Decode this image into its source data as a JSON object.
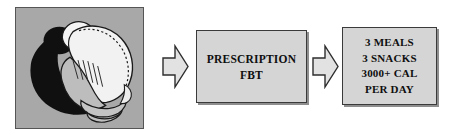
{
  "diagram": {
    "type": "flowchart",
    "orientation": "left-to-right",
    "stage_count": 3,
    "background_color": "#ffffff"
  },
  "illustration": {
    "label": "curled-figure-illustration",
    "alt_text": "Stylized drawing of a hunched, curled-over human figure casting a large dark shadow",
    "panel_background": "#a8a8a8",
    "panel_border_color": "#555555",
    "shadow_color": "#111111",
    "figure_light_color": "#f2f2f2",
    "figure_mid_color": "#bdbdbd",
    "figure_outline_color": "#1a1a1a"
  },
  "arrows": [
    {
      "name": "arrow-stage-1-to-2",
      "direction": "right",
      "fill": "#e2e2e2",
      "stroke": "#2e2e2e"
    },
    {
      "name": "arrow-stage-2-to-3",
      "direction": "right",
      "fill": "#e2e2e2",
      "stroke": "#2e2e2e"
    }
  ],
  "boxes": {
    "prescription": {
      "name": "prescription-box",
      "lines": [
        "PRESCRIPTION",
        "FBT"
      ],
      "line1": "PRESCRIPTION",
      "line2": "FBT",
      "fill": "#d5d5d5",
      "border": "#3a3a3a",
      "text_color": "#0f0f0f"
    },
    "regimen": {
      "name": "regimen-box",
      "lines": [
        "3 MEALS",
        "3 SNACKS",
        "3000+ CAL",
        "PER DAY"
      ],
      "line1": "3 MEALS",
      "line2": "3 SNACKS",
      "line3": "3000+ CAL",
      "line4": "PER DAY",
      "fill": "#d5d5d5",
      "border": "#3a3a3a",
      "text_color": "#0f0f0f"
    }
  }
}
